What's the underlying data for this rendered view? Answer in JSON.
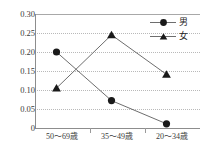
{
  "chart_data": {
    "type": "line",
    "title": "",
    "xlabel": "",
    "ylabel": "",
    "categories": [
      "50〜69歳",
      "35〜49歳",
      "20〜34歳"
    ],
    "series": [
      {
        "name": "男",
        "marker": "circle",
        "values": [
          0.2,
          0.072,
          0.011
        ]
      },
      {
        "name": "女",
        "marker": "triangle",
        "values": [
          0.105,
          0.245,
          0.141
        ]
      }
    ],
    "ylim": [
      0,
      0.3
    ],
    "yticks": [
      0,
      0.05,
      0.1,
      0.15,
      0.2,
      0.25,
      0.3
    ],
    "ytick_labels": [
      "0",
      "0.05",
      "0.10",
      "0.15",
      "0.20",
      "0.25",
      "0.30"
    ],
    "grid": true,
    "grid_style": "dotted",
    "legend_position": "top-right",
    "colors": {
      "line": "#6e6e6e",
      "marker": "#1a1a1a",
      "grid": "#b9b9b9",
      "axis": "#8d8d8d",
      "text": "#3a3a3a"
    }
  },
  "legend": {
    "entries": [
      {
        "label": "男"
      },
      {
        "label": "女"
      }
    ]
  }
}
